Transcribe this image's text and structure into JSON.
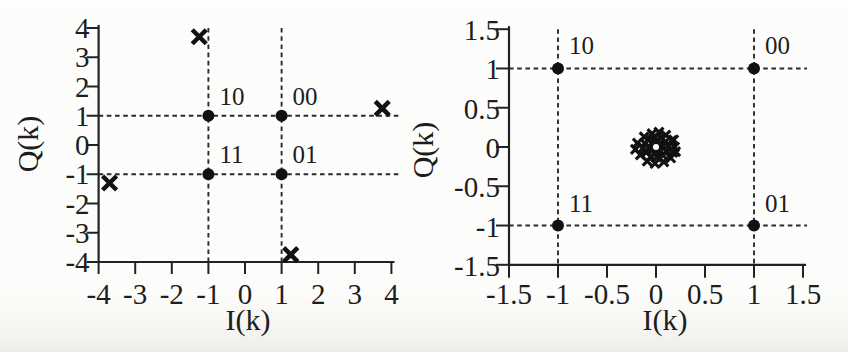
{
  "page": {
    "background": "#fcfcfa",
    "ink": "#1d1d1d"
  },
  "chart_data": [
    {
      "id": "left-constellation",
      "type": "scatter",
      "title": "",
      "xlabel": "I(k)",
      "ylabel": "Q(k)",
      "xlim": [
        -4,
        4
      ],
      "ylim": [
        -4,
        4
      ],
      "grid": false,
      "legend": null,
      "xticks": {
        "values": [
          -4,
          -3,
          -2,
          -1,
          0,
          1,
          2,
          3,
          4
        ],
        "labels": [
          "-4",
          "-3",
          "-2",
          "-1",
          "0",
          "1",
          "2",
          "3",
          "4"
        ]
      },
      "yticks": {
        "values": [
          4,
          3,
          2,
          1,
          0,
          -1,
          -2,
          -3,
          -4
        ],
        "labels": [
          "4",
          "3",
          "2",
          "1",
          "0",
          "-1",
          "-2",
          "-3",
          "-4"
        ]
      },
      "reference_lines": {
        "style": "dashed",
        "vertical": [
          -1,
          1
        ],
        "horizontal": [
          1,
          -1
        ]
      },
      "constellation_points": [
        {
          "label": "10",
          "i": -1,
          "q": 1
        },
        {
          "label": "00",
          "i": 1,
          "q": 1
        },
        {
          "label": "11",
          "i": -1,
          "q": -1
        },
        {
          "label": "01",
          "i": 1,
          "q": -1
        }
      ],
      "received_symbols": {
        "marker": "x",
        "points": [
          [
            -1.25,
            3.7
          ],
          [
            3.75,
            1.25
          ],
          [
            -3.7,
            -1.3
          ],
          [
            1.25,
            -3.75
          ]
        ]
      }
    },
    {
      "id": "right-constellation",
      "type": "scatter",
      "title": "",
      "xlabel": "I(k)",
      "ylabel": "Q(k)",
      "xlim": [
        -1.5,
        1.5
      ],
      "ylim": [
        -1.5,
        1.5
      ],
      "grid": false,
      "legend": null,
      "xticks": {
        "values": [
          -1.5,
          -1,
          -0.5,
          0,
          0.5,
          1,
          1.5
        ],
        "labels": [
          "-1.5",
          "-1",
          "-0.5",
          "0",
          "0.5",
          "1",
          "1.5"
        ]
      },
      "yticks": {
        "values": [
          1.5,
          1,
          0.5,
          0,
          -0.5,
          -1,
          -1.5
        ],
        "labels": [
          "1.5",
          "1",
          "0.5",
          "0",
          "-0.5",
          "-1",
          "-1.5"
        ]
      },
      "reference_lines": {
        "style": "dashed",
        "vertical": [
          -1,
          1
        ],
        "horizontal": [
          1,
          -1
        ]
      },
      "constellation_points": [
        {
          "label": "10",
          "i": -1,
          "q": 1
        },
        {
          "label": "00",
          "i": 1,
          "q": 1
        },
        {
          "label": "11",
          "i": -1,
          "q": -1
        },
        {
          "label": "01",
          "i": 1,
          "q": -1
        }
      ],
      "noise_cluster": {
        "marker": "x",
        "center": [
          0,
          0
        ],
        "radius": 0.22,
        "offsets": [
          [
            0.06,
            0
          ],
          [
            0.045,
            0.045
          ],
          [
            0,
            0.065
          ],
          [
            -0.045,
            0.045
          ],
          [
            -0.065,
            0
          ],
          [
            -0.045,
            -0.045
          ],
          [
            0,
            -0.06
          ],
          [
            0.045,
            -0.045
          ],
          [
            0.125,
            0.01
          ],
          [
            0.1,
            0.07
          ],
          [
            0.05,
            0.115
          ],
          [
            -0.01,
            0.125
          ],
          [
            -0.07,
            0.1
          ],
          [
            -0.115,
            0.05
          ],
          [
            -0.13,
            -0.01
          ],
          [
            -0.1,
            -0.07
          ],
          [
            -0.05,
            -0.12
          ],
          [
            0.01,
            -0.13
          ],
          [
            0.07,
            -0.105
          ],
          [
            0.115,
            -0.055
          ],
          [
            0.19,
            0
          ],
          [
            0.17,
            -0.07
          ],
          [
            0.16,
            0.08
          ],
          [
            0.1,
            0.15
          ],
          [
            0.03,
            0.19
          ],
          [
            -0.04,
            0.17
          ],
          [
            -0.12,
            0.13
          ],
          [
            -0.19,
            0.05
          ],
          [
            -0.21,
            -0.03
          ],
          [
            -0.16,
            -0.1
          ],
          [
            -0.09,
            -0.18
          ],
          [
            -0.01,
            -0.21
          ],
          [
            0.08,
            -0.19
          ],
          [
            0.15,
            -0.14
          ],
          [
            0.2,
            -0.06
          ],
          [
            0.18,
            0.09
          ]
        ]
      }
    }
  ]
}
